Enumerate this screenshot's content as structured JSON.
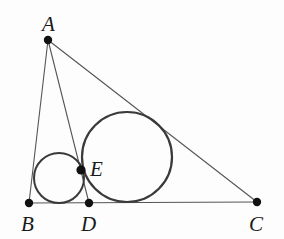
{
  "figure": {
    "background_color": "#fdfdfd",
    "stroke_color": "#555555",
    "circle_color": "#3a3a3a",
    "point_color": "#111111",
    "label_color": "#1a1a1a",
    "label_font_size": "21"
  },
  "points": [
    {
      "name": "A",
      "label": "A",
      "x": 48,
      "y": 40,
      "label_x": 42,
      "label_y": 31,
      "dot_r": 4.2
    },
    {
      "name": "B",
      "label": "B",
      "x": 29,
      "y": 203,
      "label_x": 21,
      "label_y": 231,
      "dot_r": 4.2
    },
    {
      "name": "C",
      "label": "C",
      "x": 257,
      "y": 202,
      "label_x": 249,
      "label_y": 231,
      "dot_r": 4.2
    },
    {
      "name": "D",
      "label": "D",
      "x": 89,
      "y": 203,
      "label_x": 81,
      "label_y": 231,
      "dot_r": 4.2
    },
    {
      "name": "E",
      "label": "E",
      "x": 81,
      "y": 170,
      "label_x": 90,
      "label_y": 176,
      "dot_r": 4.6
    }
  ],
  "segments": [
    {
      "name": "segment-AB",
      "from": "A",
      "to": "B",
      "x1": 48,
      "y1": 40,
      "x2": 29,
      "y2": 203
    },
    {
      "name": "segment-AC",
      "from": "A",
      "to": "C",
      "x1": 48,
      "y1": 40,
      "x2": 257,
      "y2": 202
    },
    {
      "name": "segment-AD",
      "from": "A",
      "to": "D",
      "x1": 48,
      "y1": 40,
      "x2": 89,
      "y2": 203
    },
    {
      "name": "segment-BC",
      "from": "B",
      "to": "C",
      "x1": 29,
      "y1": 203,
      "x2": 257,
      "y2": 202
    }
  ],
  "circles": [
    {
      "name": "small-circle",
      "cx": 59,
      "cy": 178,
      "r": 25,
      "stroke_width": 2.0
    },
    {
      "name": "large-circle",
      "cx": 127,
      "cy": 157,
      "r": 45,
      "stroke_width": 2.2
    }
  ]
}
